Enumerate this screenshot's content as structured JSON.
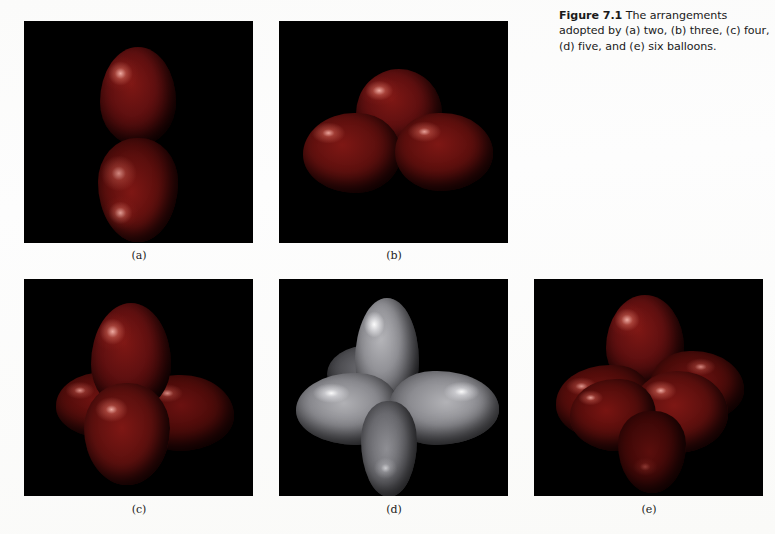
{
  "figure": {
    "label": "Figure 7.1",
    "caption_text": " The arrangements adopted by (a) two, (b) three, (c) four, (d) five, and (e) six balloons.",
    "full_caption": "Figure 7.1 The arrangements adopted by (a) two, (b) three, (c) four, (d) five, and (e) six balloons."
  },
  "panels": [
    {
      "id": "a",
      "label": "(a)",
      "count": 2,
      "arrangement": "linear",
      "balloon_color": "#7e1714",
      "background_color": "#000000"
    },
    {
      "id": "b",
      "label": "(b)",
      "count": 3,
      "arrangement": "trigonal planar",
      "balloon_color": "#7e1714",
      "background_color": "#000000"
    },
    {
      "id": "c",
      "label": "(c)",
      "count": 4,
      "arrangement": "tetrahedral",
      "balloon_color": "#7e1714",
      "background_color": "#000000"
    },
    {
      "id": "d",
      "label": "(d)",
      "count": 5,
      "arrangement": "trigonal bipyramidal",
      "balloon_color": "#b6b6ba",
      "background_color": "#000000"
    },
    {
      "id": "e",
      "label": "(e)",
      "count": 6,
      "arrangement": "octahedral",
      "balloon_color": "#7e1714",
      "background_color": "#000000"
    }
  ],
  "page": {
    "background_color": "#fdfdfc"
  }
}
